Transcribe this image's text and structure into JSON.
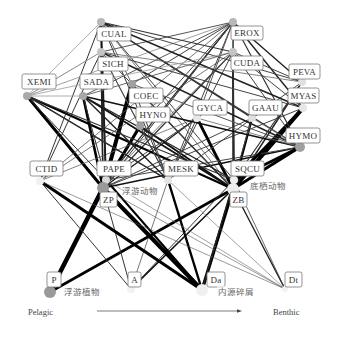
{
  "figure": {
    "width": 340,
    "height": 339,
    "axis": {
      "left_label": "Pelagic",
      "right_label": "Benthic",
      "arrow": {
        "x1": 97,
        "y1": 311,
        "x2": 242,
        "y2": 311
      }
    },
    "nodes": [
      {
        "id": "CUAL",
        "label": "CUAL",
        "x": 101,
        "y": 22,
        "r": 4,
        "color": "#b8b8b8",
        "box": {
          "x": 97,
          "y": 27,
          "w": 34,
          "h": 14
        }
      },
      {
        "id": "EROX",
        "label": "EROX",
        "x": 233,
        "y": 22,
        "r": 4,
        "color": "#b8b8b8",
        "box": {
          "x": 231,
          "y": 26,
          "w": 32,
          "h": 14
        }
      },
      {
        "id": "SICH",
        "label": "SICH",
        "x": 101,
        "y": 52,
        "r": 4,
        "color": "#c4c4c4",
        "box": {
          "x": 98,
          "y": 57,
          "w": 30,
          "h": 14
        }
      },
      {
        "id": "CUDA",
        "label": "CUDA",
        "x": 233,
        "y": 52,
        "r": 4,
        "color": "#c4c4c4",
        "box": {
          "x": 231,
          "y": 56,
          "w": 32,
          "h": 14
        }
      },
      {
        "id": "XEMI",
        "label": "XEMI",
        "x": 27,
        "y": 96,
        "r": 4,
        "color": "#a8a8a8",
        "box": {
          "x": 22,
          "y": 74,
          "w": 34,
          "h": 15
        }
      },
      {
        "id": "SADA",
        "label": "SADA",
        "x": 83,
        "y": 96,
        "r": 4,
        "color": "#a8a8a8",
        "box": {
          "x": 80,
          "y": 74,
          "w": 33,
          "h": 15
        }
      },
      {
        "id": "COEC",
        "label": "COEC",
        "x": 132,
        "y": 84,
        "r": 4,
        "color": "#a0a0a0",
        "box": {
          "x": 129,
          "y": 88,
          "w": 34,
          "h": 15
        }
      },
      {
        "id": "HYNO",
        "label": "HYNO",
        "x": 140,
        "y": 126,
        "r": 4,
        "color": "#a0a0a0",
        "box": {
          "x": 136,
          "y": 107,
          "w": 34,
          "h": 15
        }
      },
      {
        "id": "GYCA",
        "label": "GYCA",
        "x": 197,
        "y": 118,
        "r": 4,
        "color": "#e8e8e8",
        "box": {
          "x": 193,
          "y": 100,
          "w": 34,
          "h": 15
        }
      },
      {
        "id": "GAAU",
        "label": "GAAU",
        "x": 252,
        "y": 118,
        "r": 4,
        "color": "#e0e0e0",
        "box": {
          "x": 249,
          "y": 100,
          "w": 33,
          "h": 15
        }
      },
      {
        "id": "PEVA",
        "label": "PEVA",
        "x": 302,
        "y": 82,
        "r": 4,
        "color": "#e0e0e0",
        "box": {
          "x": 289,
          "y": 64,
          "w": 31,
          "h": 15
        }
      },
      {
        "id": "MYAS",
        "label": "MYAS",
        "x": 303,
        "y": 108,
        "r": 4,
        "color": "#e6e6e6",
        "box": {
          "x": 288,
          "y": 88,
          "w": 31,
          "h": 15
        }
      },
      {
        "id": "HYMO",
        "label": "HYMO",
        "x": 300,
        "y": 147,
        "r": 5,
        "color": "#a0a0a0",
        "box": {
          "x": 286,
          "y": 128,
          "w": 34,
          "h": 15
        }
      },
      {
        "id": "CTID",
        "label": "CTID",
        "x": 40,
        "y": 181,
        "r": 4,
        "color": "#f0f0f0",
        "box": {
          "x": 30,
          "y": 161,
          "w": 33,
          "h": 15
        }
      },
      {
        "id": "PAPE",
        "label": "PAPE",
        "x": 106,
        "y": 180,
        "r": 4,
        "color": "#d8d8d8",
        "box": {
          "x": 97,
          "y": 161,
          "w": 34,
          "h": 15
        }
      },
      {
        "id": "MESK",
        "label": "MESK",
        "x": 168,
        "y": 180,
        "r": 4,
        "color": "#e4e4e4",
        "box": {
          "x": 164,
          "y": 161,
          "w": 34,
          "h": 15
        }
      },
      {
        "id": "SQCU",
        "label": "SQCU",
        "x": 234,
        "y": 180,
        "r": 4,
        "color": "#eeeeee",
        "box": {
          "x": 231,
          "y": 161,
          "w": 33,
          "h": 15
        }
      },
      {
        "id": "ZP",
        "label": "ZP",
        "x": 103,
        "y": 188,
        "r": 6,
        "color": "#9a9a9a",
        "box": {
          "x": 100,
          "y": 192,
          "w": 17,
          "h": 15
        }
      },
      {
        "id": "ZB",
        "label": "ZB",
        "x": 233,
        "y": 189,
        "r": 6,
        "color": "#ededed",
        "box": {
          "x": 230,
          "y": 192,
          "w": 17,
          "h": 15
        }
      },
      {
        "id": "P",
        "label": "P",
        "x": 50,
        "y": 292,
        "r": 6,
        "color": "#9a9a9a",
        "box": {
          "x": 47,
          "y": 272,
          "w": 14,
          "h": 15
        }
      },
      {
        "id": "A",
        "label": "A",
        "x": 131,
        "y": 289,
        "r": 4,
        "color": "#f2f2f2",
        "box": {
          "x": 128,
          "y": 272,
          "w": 13,
          "h": 15
        }
      },
      {
        "id": "Da",
        "label": "Da",
        "x": 202,
        "y": 290,
        "r": 6,
        "color": "#f0f0f0",
        "box": {
          "x": 207,
          "y": 272,
          "w": 18,
          "h": 15
        }
      },
      {
        "id": "Dt",
        "label": "Dt",
        "x": 285,
        "y": 289,
        "r": 3,
        "color": "#f2f2f2",
        "box": {
          "x": 285,
          "y": 272,
          "w": 17,
          "h": 15
        }
      }
    ],
    "group_labels": [
      {
        "id": "zooplankton",
        "text": "浮游动物",
        "x": 122,
        "y": 194
      },
      {
        "id": "zoobenthos",
        "text": "底栖动物",
        "x": 250,
        "y": 189
      },
      {
        "id": "phytoplankton",
        "text": "浮游植物",
        "x": 64,
        "y": 295
      },
      {
        "id": "detritus",
        "text": "内源碎屑",
        "x": 218,
        "y": 295
      }
    ],
    "edges": [
      {
        "from": "P",
        "to": "ZP",
        "w": 4.5,
        "c": "#000000"
      },
      {
        "from": "P",
        "to": "ZB",
        "w": 2.6,
        "c": "#000000"
      },
      {
        "from": "P",
        "to": "PAPE",
        "w": 2.5,
        "c": "#000000"
      },
      {
        "from": "A",
        "to": "ZB",
        "w": 1.6,
        "c": "#111111"
      },
      {
        "from": "A",
        "to": "ZP",
        "w": 1.0,
        "c": "#333333"
      },
      {
        "from": "A",
        "to": "SQCU",
        "w": 1.0,
        "c": "#333333"
      },
      {
        "from": "A",
        "to": "CTID",
        "w": 1.0,
        "c": "#333333"
      },
      {
        "from": "A",
        "to": "MESK",
        "w": 0.8,
        "c": "#555555"
      },
      {
        "from": "Da",
        "to": "ZP",
        "w": 4.0,
        "c": "#000000"
      },
      {
        "from": "Da",
        "to": "ZB",
        "w": 3.2,
        "c": "#000000"
      },
      {
        "from": "Da",
        "to": "CTID",
        "w": 3.0,
        "c": "#000000"
      },
      {
        "from": "Da",
        "to": "MESK",
        "w": 2.4,
        "c": "#000000"
      },
      {
        "from": "Da",
        "to": "PAPE",
        "w": 2.0,
        "c": "#000000"
      },
      {
        "from": "Da",
        "to": "SQCU",
        "w": 1.4,
        "c": "#222222"
      },
      {
        "from": "Dt",
        "to": "ZB",
        "w": 1.4,
        "c": "#222222"
      },
      {
        "from": "Dt",
        "to": "CTID",
        "w": 0.6,
        "c": "#555555"
      },
      {
        "from": "Dt",
        "to": "ZP",
        "w": 0.6,
        "c": "#555555"
      },
      {
        "from": "Dt",
        "to": "PAPE",
        "w": 0.6,
        "c": "#666666"
      },
      {
        "from": "Dt",
        "to": "MESK",
        "w": 0.6,
        "c": "#666666"
      },
      {
        "from": "Dt",
        "to": "SQCU",
        "w": 0.8,
        "c": "#444444"
      },
      {
        "from": "ZP",
        "to": "XEMI",
        "w": 3.0,
        "c": "#000000"
      },
      {
        "from": "ZP",
        "to": "SADA",
        "w": 2.6,
        "c": "#000000"
      },
      {
        "from": "ZP",
        "to": "COEC",
        "w": 4.0,
        "c": "#000000"
      },
      {
        "from": "ZP",
        "to": "HYNO",
        "w": 3.2,
        "c": "#000000"
      },
      {
        "from": "ZP",
        "to": "CUAL",
        "w": 1.4,
        "c": "#222222"
      },
      {
        "from": "ZP",
        "to": "SICH",
        "w": 1.4,
        "c": "#222222"
      },
      {
        "from": "ZP",
        "to": "EROX",
        "w": 1.0,
        "c": "#333333"
      },
      {
        "from": "ZP",
        "to": "CUDA",
        "w": 1.2,
        "c": "#333333"
      },
      {
        "from": "ZP",
        "to": "GYCA",
        "w": 1.4,
        "c": "#222222"
      },
      {
        "from": "ZP",
        "to": "GAAU",
        "w": 1.0,
        "c": "#444444"
      },
      {
        "from": "ZP",
        "to": "MYAS",
        "w": 1.0,
        "c": "#444444"
      },
      {
        "from": "ZP",
        "to": "HYMO",
        "w": 1.6,
        "c": "#111111"
      },
      {
        "from": "ZB",
        "to": "HYMO",
        "w": 3.0,
        "c": "#000000"
      },
      {
        "from": "ZB",
        "to": "MYAS",
        "w": 4.2,
        "c": "#000000"
      },
      {
        "from": "ZB",
        "to": "PEVA",
        "w": 1.4,
        "c": "#222222"
      },
      {
        "from": "ZB",
        "to": "GAAU",
        "w": 2.4,
        "c": "#000000"
      },
      {
        "from": "ZB",
        "to": "GYCA",
        "w": 2.8,
        "c": "#000000"
      },
      {
        "from": "ZB",
        "to": "CUDA",
        "w": 1.2,
        "c": "#333333"
      },
      {
        "from": "ZB",
        "to": "EROX",
        "w": 1.0,
        "c": "#333333"
      },
      {
        "from": "ZB",
        "to": "HYNO",
        "w": 2.0,
        "c": "#111111"
      },
      {
        "from": "ZB",
        "to": "COEC",
        "w": 1.4,
        "c": "#222222"
      },
      {
        "from": "ZB",
        "to": "SADA",
        "w": 1.8,
        "c": "#111111"
      },
      {
        "from": "ZB",
        "to": "XEMI",
        "w": 2.2,
        "c": "#000000"
      },
      {
        "from": "ZB",
        "to": "SICH",
        "w": 1.0,
        "c": "#444444"
      },
      {
        "from": "ZB",
        "to": "CUAL",
        "w": 0.8,
        "c": "#555555"
      },
      {
        "from": "CTID",
        "to": "CUAL",
        "w": 1.0,
        "c": "#333333"
      },
      {
        "from": "CTID",
        "to": "SICH",
        "w": 1.0,
        "c": "#333333"
      },
      {
        "from": "CTID",
        "to": "EROX",
        "w": 0.8,
        "c": "#555555"
      },
      {
        "from": "CTID",
        "to": "CUDA",
        "w": 0.8,
        "c": "#555555"
      },
      {
        "from": "CTID",
        "to": "GYCA",
        "w": 0.8,
        "c": "#666666"
      },
      {
        "from": "PAPE",
        "to": "CUAL",
        "w": 1.8,
        "c": "#111111"
      },
      {
        "from": "PAPE",
        "to": "SICH",
        "w": 1.4,
        "c": "#222222"
      },
      {
        "from": "PAPE",
        "to": "XEMI",
        "w": 1.0,
        "c": "#333333"
      },
      {
        "from": "PAPE",
        "to": "SADA",
        "w": 1.0,
        "c": "#333333"
      },
      {
        "from": "PAPE",
        "to": "EROX",
        "w": 1.2,
        "c": "#333333"
      },
      {
        "from": "PAPE",
        "to": "CUDA",
        "w": 0.8,
        "c": "#555555"
      },
      {
        "from": "PAPE",
        "to": "GYCA",
        "w": 1.0,
        "c": "#444444"
      },
      {
        "from": "PAPE",
        "to": "HYMO",
        "w": 1.0,
        "c": "#444444"
      },
      {
        "from": "MESK",
        "to": "CUAL",
        "w": 1.0,
        "c": "#333333"
      },
      {
        "from": "MESK",
        "to": "SICH",
        "w": 1.0,
        "c": "#333333"
      },
      {
        "from": "MESK",
        "to": "EROX",
        "w": 1.0,
        "c": "#444444"
      },
      {
        "from": "MESK",
        "to": "CUDA",
        "w": 1.0,
        "c": "#444444"
      },
      {
        "from": "MESK",
        "to": "XEMI",
        "w": 1.4,
        "c": "#222222"
      },
      {
        "from": "MESK",
        "to": "SADA",
        "w": 1.4,
        "c": "#222222"
      },
      {
        "from": "MESK",
        "to": "COEC",
        "w": 1.0,
        "c": "#444444"
      },
      {
        "from": "MESK",
        "to": "PEVA",
        "w": 1.0,
        "c": "#444444"
      },
      {
        "from": "SQCU",
        "to": "CUDA",
        "w": 1.6,
        "c": "#111111"
      },
      {
        "from": "SQCU",
        "to": "EROX",
        "w": 1.0,
        "c": "#333333"
      },
      {
        "from": "SQCU",
        "to": "MYAS",
        "w": 2.6,
        "c": "#000000"
      },
      {
        "from": "SQCU",
        "to": "HYMO",
        "w": 2.8,
        "c": "#000000"
      },
      {
        "from": "SQCU",
        "to": "PEVA",
        "w": 1.2,
        "c": "#333333"
      },
      {
        "from": "SQCU",
        "to": "GAAU",
        "w": 1.0,
        "c": "#444444"
      },
      {
        "from": "SQCU",
        "to": "SADA",
        "w": 1.4,
        "c": "#222222"
      },
      {
        "from": "SQCU",
        "to": "XEMI",
        "w": 1.2,
        "c": "#333333"
      },
      {
        "from": "SQCU",
        "to": "CUAL",
        "w": 1.0,
        "c": "#444444"
      },
      {
        "from": "EROX",
        "to": "XEMI",
        "w": 0.8,
        "c": "#888888"
      },
      {
        "from": "EROX",
        "to": "SADA",
        "w": 1.0,
        "c": "#555555"
      },
      {
        "from": "EROX",
        "to": "SICH",
        "w": 1.0,
        "c": "#555555"
      },
      {
        "from": "EROX",
        "to": "COEC",
        "w": 1.0,
        "c": "#444444"
      },
      {
        "from": "EROX",
        "to": "HYNO",
        "w": 1.0,
        "c": "#444444"
      },
      {
        "from": "EROX",
        "to": "GYCA",
        "w": 1.0,
        "c": "#555555"
      },
      {
        "from": "EROX",
        "to": "MYAS",
        "w": 1.4,
        "c": "#222222"
      },
      {
        "from": "EROX",
        "to": "PEVA",
        "w": 1.4,
        "c": "#222222"
      },
      {
        "from": "EROX",
        "to": "HYMO",
        "w": 1.2,
        "c": "#333333"
      },
      {
        "from": "CUAL",
        "to": "XEMI",
        "w": 0.8,
        "c": "#999999"
      },
      {
        "from": "CUAL",
        "to": "CUDA",
        "w": 1.2,
        "c": "#333333"
      },
      {
        "from": "CUAL",
        "to": "PEVA",
        "w": 1.0,
        "c": "#444444"
      },
      {
        "from": "CUAL",
        "to": "MYAS",
        "w": 1.4,
        "c": "#222222"
      },
      {
        "from": "CUAL",
        "to": "GAAU",
        "w": 1.2,
        "c": "#333333"
      },
      {
        "from": "CUAL",
        "to": "HYMO",
        "w": 1.2,
        "c": "#333333"
      },
      {
        "from": "CUAL",
        "to": "COEC",
        "w": 1.0,
        "c": "#666666"
      },
      {
        "from": "SICH",
        "to": "XEMI",
        "w": 1.0,
        "c": "#888888"
      },
      {
        "from": "SICH",
        "to": "HYMO",
        "w": 1.4,
        "c": "#222222"
      },
      {
        "from": "SICH",
        "to": "MYAS",
        "w": 1.0,
        "c": "#444444"
      },
      {
        "from": "SICH",
        "to": "PEVA",
        "w": 0.8,
        "c": "#666666"
      },
      {
        "from": "SICH",
        "to": "HYNO",
        "w": 1.0,
        "c": "#555555"
      },
      {
        "from": "CUDA",
        "to": "XEMI",
        "w": 0.8,
        "c": "#999999"
      },
      {
        "from": "CUDA",
        "to": "SADA",
        "w": 1.0,
        "c": "#666666"
      },
      {
        "from": "CUDA",
        "to": "HYMO",
        "w": 1.0,
        "c": "#444444"
      },
      {
        "from": "CUDA",
        "to": "MYAS",
        "w": 1.0,
        "c": "#444444"
      },
      {
        "from": "CUDA",
        "to": "PEVA",
        "w": 1.0,
        "c": "#444444"
      },
      {
        "from": "SADA",
        "to": "HYMO",
        "w": 1.6,
        "c": "#111111"
      },
      {
        "from": "XEMI",
        "to": "MESK",
        "w": 1.2,
        "c": "#333333"
      },
      {
        "from": "XEMI",
        "to": "SADA",
        "w": 0.8,
        "c": "#999999"
      },
      {
        "from": "HYNO",
        "to": "MESK",
        "w": 1.0,
        "c": "#444444"
      },
      {
        "from": "COEC",
        "to": "HYMO",
        "w": 1.0,
        "c": "#555555"
      },
      {
        "from": "GYCA",
        "to": "MESK",
        "w": 1.0,
        "c": "#444444"
      },
      {
        "from": "GYCA",
        "to": "HYMO",
        "w": 0.8,
        "c": "#666666"
      },
      {
        "from": "GAAU",
        "to": "HYMO",
        "w": 0.8,
        "c": "#666666"
      }
    ]
  }
}
